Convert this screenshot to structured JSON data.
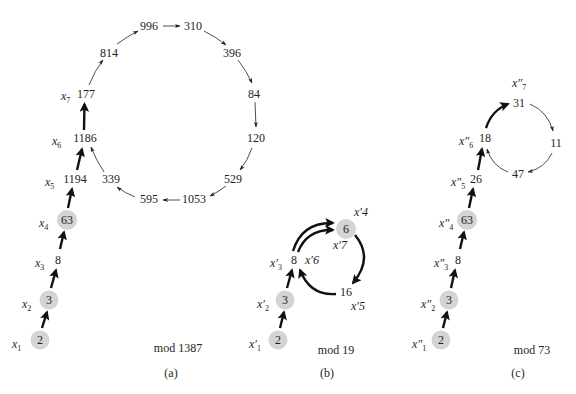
{
  "figure": {
    "panels": [
      {
        "id": "a",
        "modulus_label": "mod 1387",
        "panel_label": "(a)",
        "tail_nodes": [
          {
            "value": "2",
            "label": "x",
            "sub": "1",
            "highlight": true
          },
          {
            "value": "3",
            "label": "x",
            "sub": "2",
            "highlight": true
          },
          {
            "value": "8",
            "label": "x",
            "sub": "3",
            "highlight": false
          },
          {
            "value": "63",
            "label": "x",
            "sub": "4",
            "highlight": true
          },
          {
            "value": "1194",
            "label": "x",
            "sub": "5",
            "highlight": false
          },
          {
            "value": "1186",
            "label": "x",
            "sub": "6",
            "highlight": false
          },
          {
            "value": "177",
            "label": "x",
            "sub": "7",
            "highlight": false
          }
        ],
        "cycle_nodes": [
          "814",
          "996",
          "310",
          "396",
          "84",
          "120",
          "529",
          "1053",
          "595",
          "339"
        ]
      },
      {
        "id": "b",
        "modulus_label": "mod 19",
        "panel_label": "(b)",
        "tail_nodes": [
          {
            "value": "2",
            "label": "x′",
            "sub": "1",
            "highlight": true
          },
          {
            "value": "3",
            "label": "x′",
            "sub": "2",
            "highlight": true
          },
          {
            "value": "8",
            "label": "x′",
            "sub": "3",
            "highlight": false
          }
        ],
        "cycle_nodes": [
          {
            "value": "6",
            "labels": [
              "x′4",
              "x′7"
            ],
            "highlight": true
          },
          {
            "value": "16",
            "labels": [
              "x′5"
            ],
            "highlight": false
          }
        ],
        "extra_labels": {
          "node_8_second": "x′6"
        }
      },
      {
        "id": "c",
        "modulus_label": "mod 73",
        "panel_label": "(c)",
        "tail_nodes": [
          {
            "value": "2",
            "label": "x″",
            "sub": "1",
            "highlight": true
          },
          {
            "value": "3",
            "label": "x″",
            "sub": "2",
            "highlight": true
          },
          {
            "value": "8",
            "label": "x″",
            "sub": "3",
            "highlight": false
          },
          {
            "value": "63",
            "label": "x″",
            "sub": "4",
            "highlight": true
          },
          {
            "value": "26",
            "label": "x″",
            "sub": "5",
            "highlight": false
          },
          {
            "value": "18",
            "label": "x″",
            "sub": "6",
            "highlight": false
          },
          {
            "value": "31",
            "label": "x″",
            "sub": "7",
            "highlight": false
          }
        ],
        "cycle_nodes": [
          "11",
          "47"
        ]
      }
    ],
    "colors": {
      "node_highlight": "#d4d4d4",
      "ink": "#231f20"
    }
  }
}
